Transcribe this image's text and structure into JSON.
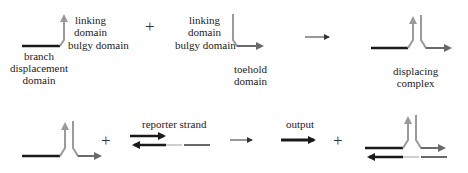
{
  "colors": {
    "branch_domain": "#1a1a1a",
    "linking_domain": "#9a9a9a",
    "toehold_domain": "#6a6a6a",
    "bulge_gap": "#cfcfcf",
    "arrow": "#333333"
  },
  "row1": {
    "strand1": {
      "labels": {
        "linking": "linking\ndomain",
        "linking_line1": "linking",
        "linking_line2": "domain",
        "bulgy": "bulgy domain",
        "branch_line1": "branch",
        "branch_line2": "displacement",
        "branch_line3": "domain"
      }
    },
    "plus": "+",
    "strand2": {
      "labels": {
        "linking_line1": "linking",
        "linking_line2": "domain",
        "bulgy": "bulgy domain",
        "toehold_line1": "toehold",
        "toehold_line2": "domain"
      }
    },
    "reaction_arrow": "→",
    "product": {
      "label_line1": "displacing",
      "label_line2": "complex"
    }
  },
  "row2": {
    "plus1": "+",
    "reporter": {
      "label": "reporter strand"
    },
    "reaction_arrow": "→",
    "output": {
      "label": "output"
    },
    "plus2": "+"
  }
}
